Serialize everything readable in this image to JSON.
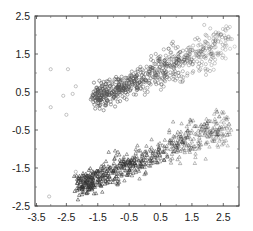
{
  "chart_data": {
    "type": "scatter",
    "title": "",
    "xlabel": "",
    "ylabel": "",
    "xlim": [
      -3.5,
      3.0
    ],
    "ylim": [
      -2.5,
      2.5
    ],
    "grid": false,
    "legend": null,
    "x_ticks": [
      "-3.5",
      "-2.5",
      "-1.5",
      "-0.5",
      "0.5",
      "1.5",
      "2.5"
    ],
    "y_ticks": [
      "2.5",
      "1.5",
      "0.5",
      "-0.5",
      "-1.5",
      "-2.5"
    ],
    "series": [
      {
        "name": "upper branch",
        "marker": "circle",
        "color": "#555555",
        "description": "dense band rising from about (-1.5, 0.3) to (2.7, 1.9)",
        "trend": {
          "x_start": -1.6,
          "y_start": 0.35,
          "x_end": 2.7,
          "y_end": 1.85,
          "spread": 0.28,
          "count": 650
        }
      },
      {
        "name": "lower branch",
        "marker": "triangle",
        "color": "#333333",
        "description": "dense band rising from about (-2.0, -2.0) to (2.7, -0.3)",
        "trend": {
          "x_start": -2.1,
          "y_start": -1.95,
          "x_end": 2.7,
          "y_end": -0.35,
          "spread": 0.27,
          "count": 650
        }
      },
      {
        "name": "outliers",
        "marker": "circle",
        "color": "#777777",
        "points": [
          [
            -3.0,
            1.1
          ],
          [
            -2.45,
            1.1
          ],
          [
            -3.0,
            0.1
          ],
          [
            -2.5,
            -0.1
          ],
          [
            -3.05,
            -2.25
          ],
          [
            -2.2,
            -1.6
          ],
          [
            -1.8,
            -1.85
          ],
          [
            -2.2,
            0.65
          ],
          [
            -2.6,
            0.4
          ],
          [
            -2.3,
            0.45
          ]
        ]
      }
    ]
  }
}
